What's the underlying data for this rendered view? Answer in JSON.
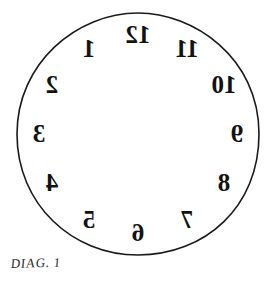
{
  "figure": {
    "kind": "mirrored-clock-face-diagram",
    "caption": "DIAG. 1",
    "background_color": "#ffffff",
    "ink_color": "#121212",
    "outline_color": "#1a1a1a"
  },
  "clock": {
    "center_x": 123,
    "center_y": 123,
    "radius": 121,
    "numeral_radius": 99,
    "mirrored": true,
    "numerals": [
      {
        "label": "12",
        "hour": 12,
        "angle_deg": -90,
        "x": 123,
        "y": 24
      },
      {
        "label": "11",
        "hour": 11,
        "angle_deg": -60,
        "x": 172,
        "y": 38
      },
      {
        "label": "10",
        "hour": 10,
        "angle_deg": -30,
        "x": 209,
        "y": 74
      },
      {
        "label": "9",
        "hour": 9,
        "angle_deg": 0,
        "x": 222,
        "y": 123
      },
      {
        "label": "8",
        "hour": 8,
        "angle_deg": 30,
        "x": 209,
        "y": 172
      },
      {
        "label": "7",
        "hour": 7,
        "angle_deg": 60,
        "x": 172,
        "y": 209
      },
      {
        "label": "6",
        "hour": 6,
        "angle_deg": 90,
        "x": 123,
        "y": 222
      },
      {
        "label": "5",
        "hour": 5,
        "angle_deg": 120,
        "x": 74,
        "y": 209
      },
      {
        "label": "4",
        "hour": 4,
        "angle_deg": 150,
        "x": 37,
        "y": 172
      },
      {
        "label": "3",
        "hour": 3,
        "angle_deg": 180,
        "x": 24,
        "y": 123
      },
      {
        "label": "2",
        "hour": 2,
        "angle_deg": 210,
        "x": 37,
        "y": 74
      },
      {
        "label": "1",
        "hour": 1,
        "angle_deg": 240,
        "x": 74,
        "y": 38
      }
    ]
  }
}
